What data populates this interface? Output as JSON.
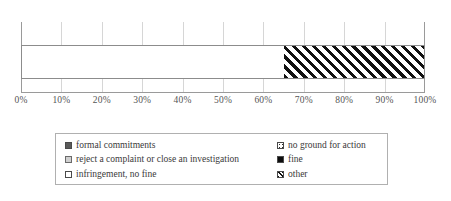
{
  "chart_data": {
    "type": "bar",
    "orientation": "horizontal",
    "stacked": true,
    "title": "",
    "xlabel": "",
    "ylabel": "",
    "categories": [
      ""
    ],
    "xlim": [
      0,
      100
    ],
    "grid": true,
    "legend_position": "bottom",
    "tick_labels": [
      "0%",
      "10%",
      "20%",
      "30%",
      "40%",
      "50%",
      "60%",
      "70%",
      "80%",
      "90%",
      "100%"
    ],
    "tick_values": [
      0,
      10,
      20,
      30,
      40,
      50,
      60,
      70,
      80,
      90,
      100
    ],
    "series": [
      {
        "name": "reject a complaint or close an investigation",
        "values": [
          65
        ],
        "pattern": "dots"
      },
      {
        "name": "other",
        "values": [
          35
        ],
        "pattern": "diagonal-hatch"
      }
    ],
    "segments": [
      {
        "label": "reject a complaint or close an investigation",
        "value": 65,
        "pattern": "dots"
      },
      {
        "label": "other",
        "value": 35,
        "pattern": "diagonal-hatch"
      }
    ]
  },
  "legend": {
    "entries": [
      {
        "label": "formal commitments",
        "swatch": "solid-dark"
      },
      {
        "label": "no ground for action",
        "swatch": "sparse-dots"
      },
      {
        "label": "reject a complaint or close an investigation",
        "swatch": "grey-fill"
      },
      {
        "label": "fine",
        "swatch": "solid-black"
      },
      {
        "label": "infringement, no fine",
        "swatch": "white"
      },
      {
        "label": "other",
        "swatch": "diagonal-hatch"
      }
    ]
  },
  "colors": {
    "axis": "#9a9a9a",
    "gridline": "#d6d6d6",
    "bar_border": "#8c8c8c",
    "hatch": "#111111",
    "text": "#3a3a3a",
    "legend_border": "#b0b0b0"
  }
}
